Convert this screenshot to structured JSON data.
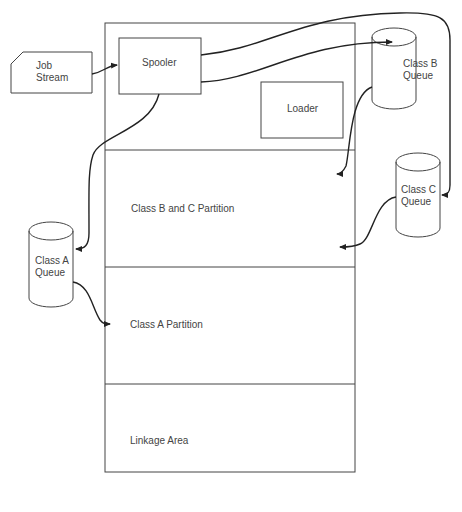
{
  "diagram": {
    "job_stream": {
      "line1": "Job",
      "line2": "Stream"
    },
    "spooler": {
      "label": "Spooler"
    },
    "loader": {
      "label": "Loader"
    },
    "queues": {
      "class_b": {
        "line1": "Class B",
        "line2": "Queue"
      },
      "class_c": {
        "line1": "Class C",
        "line2": "Queue"
      },
      "class_a": {
        "line1": "Class A",
        "line2": "Queue"
      }
    },
    "partitions": [
      {
        "label": "Class B and C Partition"
      },
      {
        "label": "Class A Partition"
      },
      {
        "label": "Linkage Area"
      }
    ],
    "colors": {
      "stroke": "#333333",
      "background": "#ffffff"
    }
  }
}
